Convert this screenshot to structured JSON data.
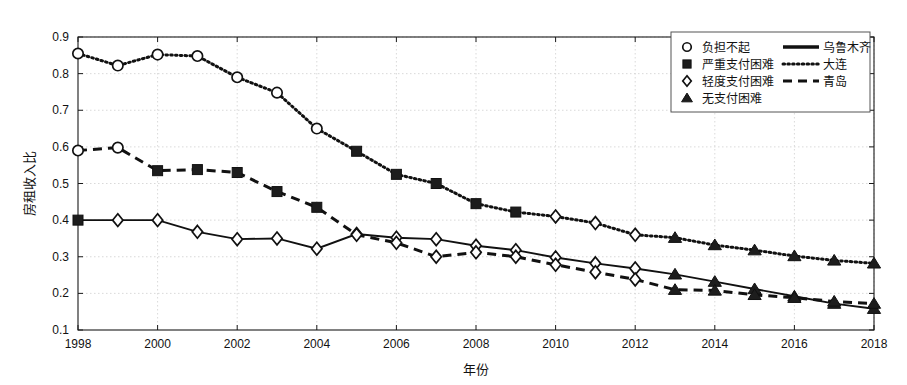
{
  "chart_data": {
    "type": "line",
    "title": "",
    "xlabel": "年份",
    "ylabel": "房租收入比",
    "xlim": [
      1998,
      2018
    ],
    "ylim": [
      0.1,
      0.9
    ],
    "grid": true,
    "x": [
      1998,
      1999,
      2000,
      2001,
      2002,
      2003,
      2004,
      2005,
      2006,
      2007,
      2008,
      2009,
      2010,
      2011,
      2012,
      2013,
      2014,
      2015,
      2016,
      2017,
      2018
    ],
    "xticks": [
      "1998",
      "2000",
      "2002",
      "2004",
      "2006",
      "2008",
      "2010",
      "2012",
      "2014",
      "2016",
      "2018"
    ],
    "xtick_values": [
      1998,
      2000,
      2002,
      2004,
      2006,
      2008,
      2010,
      2012,
      2014,
      2016,
      2018
    ],
    "yticks": [
      "0.1",
      "0.2",
      "0.3",
      "0.4",
      "0.5",
      "0.6",
      "0.7",
      "0.8",
      "0.9"
    ],
    "ytick_values": [
      0.1,
      0.2,
      0.3,
      0.4,
      0.5,
      0.6,
      0.7,
      0.8,
      0.9
    ],
    "legend_position": "top-right",
    "series": [
      {
        "name": "乌鲁木齐",
        "linestyle": "solid",
        "color": "#111111",
        "values": [
          0.4,
          0.4,
          0.4,
          0.368,
          0.348,
          0.35,
          0.322,
          0.362,
          0.352,
          0.348,
          0.33,
          0.318,
          0.298,
          0.282,
          0.268,
          0.252,
          0.232,
          0.212,
          0.192,
          0.172,
          0.158
        ],
        "markers": [
          "square",
          "diamond",
          "diamond",
          "diamond",
          "diamond",
          "diamond",
          "diamond",
          "diamond",
          "diamond",
          "diamond",
          "diamond",
          "diamond",
          "diamond",
          "diamond",
          "diamond",
          "triangle",
          "triangle",
          "triangle",
          "triangle",
          "triangle",
          "triangle"
        ]
      },
      {
        "name": "大连",
        "linestyle": "dotted",
        "color": "#111111",
        "values": [
          0.855,
          0.822,
          0.852,
          0.848,
          0.79,
          0.748,
          0.65,
          0.588,
          0.525,
          0.5,
          0.445,
          0.422,
          0.41,
          0.392,
          0.36,
          0.352,
          0.332,
          0.318,
          0.302,
          0.29,
          0.282
        ],
        "markers": [
          "circle",
          "circle",
          "circle",
          "circle",
          "circle",
          "circle",
          "circle",
          "square",
          "square",
          "square",
          "square",
          "square",
          "diamond",
          "diamond",
          "diamond",
          "triangle",
          "triangle",
          "triangle",
          "triangle",
          "triangle",
          "triangle"
        ]
      },
      {
        "name": "青岛",
        "linestyle": "dashed",
        "color": "#111111",
        "values": [
          0.59,
          0.598,
          0.535,
          0.538,
          0.53,
          0.478,
          0.435,
          0.36,
          0.338,
          0.3,
          0.312,
          0.3,
          0.278,
          0.258,
          0.238,
          0.21,
          0.208,
          0.196,
          0.188,
          0.178,
          0.172
        ],
        "markers": [
          "circle",
          "circle",
          "square",
          "square",
          "square",
          "square",
          "square",
          "diamond",
          "diamond",
          "diamond",
          "diamond",
          "diamond",
          "diamond",
          "diamond",
          "diamond",
          "triangle",
          "triangle",
          "triangle",
          "triangle",
          "triangle",
          "triangle"
        ]
      }
    ],
    "marker_legend": [
      {
        "marker": "circle",
        "label": "负担不起"
      },
      {
        "marker": "square",
        "label": "严重支付困难"
      },
      {
        "marker": "diamond",
        "label": "轻度支付困难"
      },
      {
        "marker": "triangle",
        "label": "无支付困难"
      }
    ],
    "line_legend": [
      {
        "linestyle": "solid",
        "label": "乌鲁木齐"
      },
      {
        "linestyle": "dotted",
        "label": "大连"
      },
      {
        "linestyle": "dashed",
        "label": "青岛"
      }
    ]
  }
}
